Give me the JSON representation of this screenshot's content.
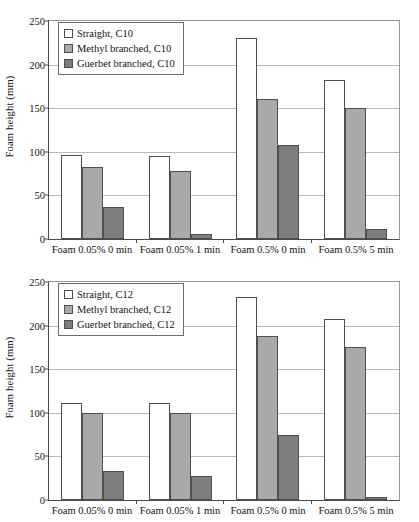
{
  "figure": {
    "background": "#ffffff",
    "series_colors": {
      "straight": "#ffffff",
      "methyl": "#a9a9a9",
      "guerbet": "#7d7d7d"
    },
    "axis_color": "#4a4a4a",
    "grid_color": "#b9b9b9"
  },
  "charts": [
    {
      "id": "chart-top",
      "ylabel": "Foam height (mm)",
      "yticks": [
        "0",
        "50",
        "100",
        "150",
        "200",
        "250"
      ],
      "categories": [
        "Foam 0.05% 0 min",
        "Foam 0.05% 1 min",
        "Foam 0.5% 0 min",
        "Foam 0.5% 5 min"
      ],
      "legend": [
        "Straight, C10",
        "Methyl branched, C10",
        "Guerbet branched, C10"
      ]
    },
    {
      "id": "chart-bottom",
      "ylabel": "Foam height (mm)",
      "yticks": [
        "0",
        "50",
        "100",
        "150",
        "200",
        "250"
      ],
      "categories": [
        "Foam 0.05% 0 min",
        "Foam 0.05% 1 min",
        "Foam 0.5% 0 min",
        "Foam 0.5% 5 min"
      ],
      "legend": [
        "Straight, C12",
        "Methyl branched, C12",
        "Guerbet branched, C12"
      ]
    }
  ],
  "chart_data": [
    {
      "type": "bar",
      "title": "",
      "xlabel": "",
      "ylabel": "Foam height (mm)",
      "ylim": [
        0,
        250
      ],
      "ytick_step": 50,
      "grid": true,
      "legend_position": "top-left",
      "categories": [
        "Foam 0.05% 0 min",
        "Foam 0.05% 1 min",
        "Foam 0.5% 0 min",
        "Foam 0.5% 5 min"
      ],
      "series": [
        {
          "name": "Straight, C10",
          "color": "#ffffff",
          "values": [
            96,
            95,
            230,
            182
          ]
        },
        {
          "name": "Methyl branched, C10",
          "color": "#a9a9a9",
          "values": [
            83,
            78,
            160,
            150
          ]
        },
        {
          "name": "Guerbet branched, C10",
          "color": "#7d7d7d",
          "values": [
            37,
            6,
            108,
            12
          ]
        }
      ]
    },
    {
      "type": "bar",
      "title": "",
      "xlabel": "",
      "ylabel": "Foam height (mm)",
      "ylim": [
        0,
        250
      ],
      "ytick_step": 50,
      "grid": true,
      "legend_position": "top-left",
      "categories": [
        "Foam 0.05% 0 min",
        "Foam 0.05% 1 min",
        "Foam 0.5% 0 min",
        "Foam 0.5% 5 min"
      ],
      "series": [
        {
          "name": "Straight, C12",
          "color": "#ffffff",
          "values": [
            111,
            111,
            233,
            208
          ]
        },
        {
          "name": "Methyl branched, C12",
          "color": "#a9a9a9",
          "values": [
            100,
            100,
            188,
            176
          ]
        },
        {
          "name": "Guerbet branched, C12",
          "color": "#7d7d7d",
          "values": [
            33,
            27,
            75,
            3
          ]
        }
      ]
    }
  ]
}
